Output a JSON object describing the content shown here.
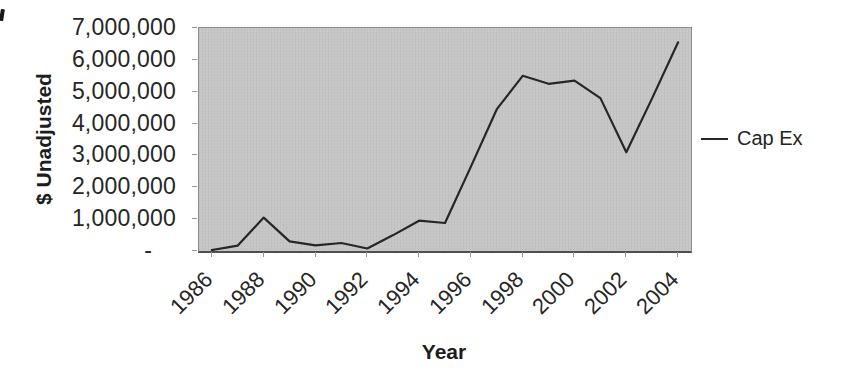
{
  "chart_data": {
    "type": "line",
    "title": "",
    "xlabel": "Year",
    "ylabel": "$ Unadjusted",
    "x": [
      1986,
      1987,
      1988,
      1989,
      1990,
      1991,
      1992,
      1993,
      1994,
      1995,
      1996,
      1997,
      1998,
      1999,
      2000,
      2001,
      2002,
      2003,
      2004
    ],
    "series": [
      {
        "name": "Cap Ex",
        "values": [
          30000,
          170000,
          1050000,
          300000,
          180000,
          250000,
          80000,
          500000,
          950000,
          880000,
          2650000,
          4450000,
          5500000,
          5250000,
          5350000,
          4800000,
          3100000,
          4800000,
          6550000
        ]
      }
    ],
    "ylim": [
      0,
      7000000
    ],
    "ytick_values": [
      0,
      1000000,
      2000000,
      3000000,
      4000000,
      5000000,
      6000000,
      7000000
    ],
    "ytick_labels": [
      "-",
      "1,000,000",
      "2,000,000",
      "3,000,000",
      "4,000,000",
      "5,000,000",
      "6,000,000",
      "7,000,000"
    ],
    "xtick_labels": [
      "1986",
      "1988",
      "1990",
      "1992",
      "1994",
      "1996",
      "1998",
      "2000",
      "2002",
      "2004"
    ],
    "xtick_every": 2,
    "grid": false,
    "legend_position": "right",
    "plot_bg_color": "#c6c6c6",
    "line_color": "#262626",
    "text_color": "#222222"
  }
}
